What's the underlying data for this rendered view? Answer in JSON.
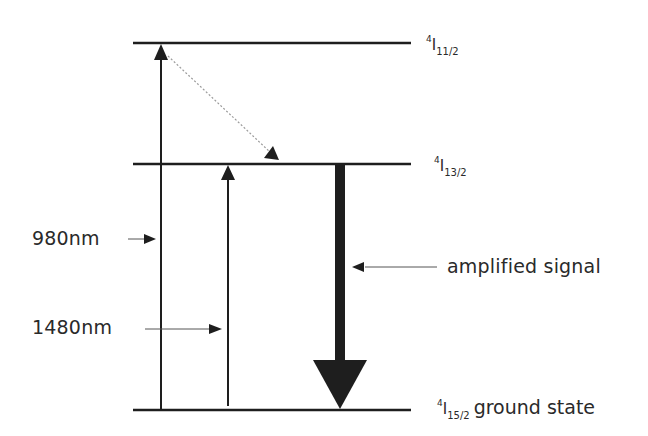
{
  "levels": {
    "top": {
      "sup": "4",
      "symbol": "I",
      "sub": "11/2"
    },
    "middle": {
      "sup": "4",
      "symbol": "I",
      "sub": "13/2"
    },
    "bottom": {
      "sup": "4",
      "symbol": "I",
      "sub": "15/2",
      "extra": "ground state"
    }
  },
  "pump_labels": {
    "pump_980": "980nm",
    "pump_1480": "1480nm"
  },
  "signal_label": "amplified signal",
  "colors": {
    "line": "#1e1e1e",
    "text": "#2a2a2a",
    "dotted": "#9a9a9a"
  }
}
